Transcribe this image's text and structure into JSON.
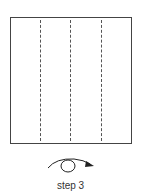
{
  "diagram": {
    "type": "origami-step",
    "paper": {
      "shape": "square",
      "fold_lines": [
        {
          "style": "valley-dashed",
          "x_fraction": 0.25
        },
        {
          "style": "valley-dashed",
          "x_fraction": 0.5
        },
        {
          "style": "valley-dashed",
          "x_fraction": 0.75
        }
      ]
    },
    "instruction_icon": "turn-over-icon",
    "label": "step 3"
  }
}
